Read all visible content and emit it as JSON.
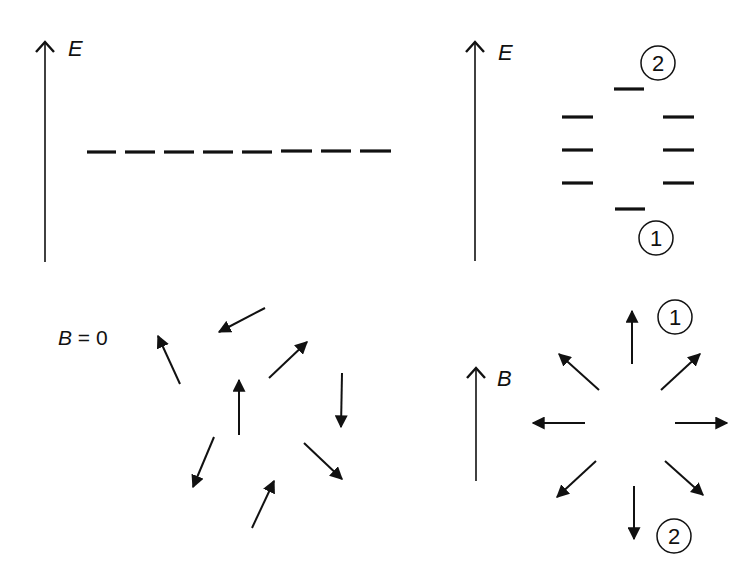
{
  "panels": {
    "top_left": {
      "axis_label": "E",
      "axis": {
        "x": 45,
        "y1": 262,
        "y2": 42
      },
      "label_pos": {
        "x": 68,
        "y": 56
      },
      "levels": [
        {
          "x1": 87,
          "x2": 116,
          "y": 152
        },
        {
          "x1": 125,
          "x2": 155,
          "y": 152
        },
        {
          "x1": 164,
          "x2": 194,
          "y": 152
        },
        {
          "x1": 203,
          "x2": 233,
          "y": 152
        },
        {
          "x1": 242,
          "x2": 272,
          "y": 152
        },
        {
          "x1": 281,
          "x2": 312,
          "y": 151
        },
        {
          "x1": 321,
          "x2": 351,
          "y": 151
        },
        {
          "x1": 360,
          "x2": 391,
          "y": 151
        }
      ]
    },
    "top_right": {
      "axis_label": "E",
      "axis": {
        "x": 475,
        "y1": 261,
        "y2": 42
      },
      "label_pos": {
        "x": 498,
        "y": 60
      },
      "levels": [
        {
          "x1": 614,
          "x2": 644,
          "y": 89
        },
        {
          "x1": 562,
          "x2": 593,
          "y": 117
        },
        {
          "x1": 663,
          "x2": 694,
          "y": 117
        },
        {
          "x1": 562,
          "x2": 593,
          "y": 150
        },
        {
          "x1": 663,
          "x2": 694,
          "y": 150
        },
        {
          "x1": 562,
          "x2": 593,
          "y": 183
        },
        {
          "x1": 663,
          "x2": 694,
          "y": 183
        },
        {
          "x1": 615,
          "x2": 645,
          "y": 209
        }
      ],
      "circled": [
        {
          "text": "2",
          "cx": 658,
          "cy": 63
        },
        {
          "text": "1",
          "cx": 656,
          "cy": 238
        }
      ]
    },
    "bottom_left": {
      "label": "B = 0",
      "label_parts": {
        "var": "B",
        "rest": " = 0"
      },
      "label_pos": {
        "x": 58,
        "y": 345
      },
      "arrows": [
        {
          "x1": 265,
          "y1": 308,
          "x2": 219,
          "y2": 332
        },
        {
          "x1": 180,
          "y1": 384,
          "x2": 158,
          "y2": 336
        },
        {
          "x1": 269,
          "y1": 378,
          "x2": 307,
          "y2": 342
        },
        {
          "x1": 239,
          "y1": 435,
          "x2": 239,
          "y2": 380
        },
        {
          "x1": 342,
          "y1": 373,
          "x2": 341,
          "y2": 427
        },
        {
          "x1": 214,
          "y1": 437,
          "x2": 193,
          "y2": 487
        },
        {
          "x1": 304,
          "y1": 443,
          "x2": 342,
          "y2": 479
        },
        {
          "x1": 252,
          "y1": 528,
          "x2": 274,
          "y2": 481
        }
      ]
    },
    "bottom_right": {
      "axis_label": "B",
      "axis": {
        "x": 476,
        "y1": 481,
        "y2": 368
      },
      "label_pos": {
        "x": 497,
        "y": 386
      },
      "arrows": [
        {
          "x1": 632,
          "y1": 364,
          "x2": 632,
          "y2": 311
        },
        {
          "x1": 599,
          "y1": 390,
          "x2": 559,
          "y2": 354
        },
        {
          "x1": 661,
          "y1": 390,
          "x2": 700,
          "y2": 354
        },
        {
          "x1": 585,
          "y1": 423,
          "x2": 533,
          "y2": 423
        },
        {
          "x1": 675,
          "y1": 423,
          "x2": 727,
          "y2": 423
        },
        {
          "x1": 596,
          "y1": 461,
          "x2": 557,
          "y2": 497
        },
        {
          "x1": 665,
          "y1": 461,
          "x2": 703,
          "y2": 495
        },
        {
          "x1": 634,
          "y1": 486,
          "x2": 634,
          "y2": 539
        }
      ],
      "circled": [
        {
          "text": "1",
          "cx": 675,
          "cy": 317
        },
        {
          "text": "2",
          "cx": 674,
          "cy": 536
        }
      ]
    }
  },
  "colors": {
    "ink": "#111111",
    "background": "#ffffff"
  }
}
